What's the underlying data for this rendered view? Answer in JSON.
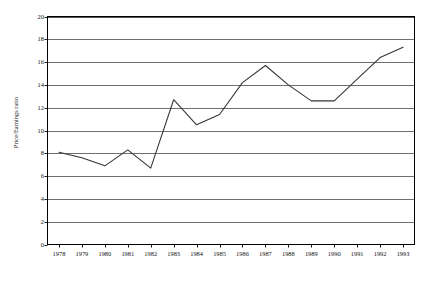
{
  "chart_data": {
    "type": "line",
    "title": "",
    "subtitle": "",
    "xlabel": "",
    "ylabel": "Price/Earnings ratio",
    "categories": [
      "1978",
      "1979",
      "1980",
      "1981",
      "1982",
      "1983",
      "1984",
      "1985",
      "1986",
      "1987",
      "1988",
      "1989",
      "1990",
      "1991",
      "1992",
      "1993"
    ],
    "series": [
      {
        "name": "Price/Earnings ratio",
        "values": [
          8.1,
          7.6,
          6.9,
          8.3,
          6.7,
          12.7,
          10.5,
          11.4,
          14.2,
          15.7,
          14.0,
          12.6,
          12.6,
          14.5,
          16.4,
          17.3
        ],
        "color": "#333333"
      }
    ],
    "ylim": [
      0,
      20
    ],
    "yticks": [
      "0",
      "2",
      "4",
      "6",
      "8",
      "10",
      "12",
      "14",
      "16",
      "18",
      "20"
    ],
    "ytick_values": [
      0,
      2,
      4,
      6,
      8,
      10,
      12,
      14,
      16,
      18,
      20
    ],
    "grid": {
      "horizontal": true,
      "vertical": false,
      "color": "#555555"
    },
    "legend": {
      "visible": false,
      "position": "none",
      "entries": []
    },
    "annotations": [],
    "plot_border_color": "#000000",
    "background_color": "#ffffff"
  }
}
